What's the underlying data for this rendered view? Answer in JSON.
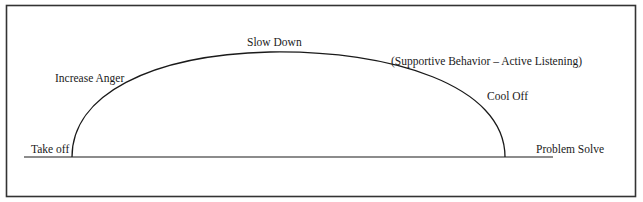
{
  "diagram": {
    "type": "anger-cycle-arc",
    "labels": {
      "take_off": "Take off",
      "increase_anger": "Increase Anger",
      "slow_down": "Slow Down",
      "supportive": "(Supportive Behavior – Active Listening)",
      "cool_off": "Cool Off",
      "problem_solve": "Problem Solve"
    },
    "colors": {
      "line": "#1a1a1a",
      "frame": "#333333",
      "background": "#ffffff"
    }
  }
}
